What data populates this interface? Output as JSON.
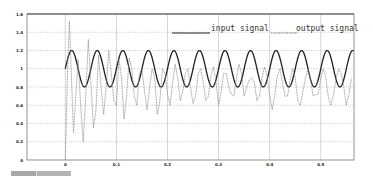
{
  "chart_data": {
    "type": "line",
    "title": "",
    "xlabel": "",
    "ylabel": "",
    "xlim": [
      -0.075,
      0.565
    ],
    "ylim": [
      0,
      1.6
    ],
    "grid": true,
    "legend_position": "top-right",
    "x_ticks": [
      "0",
      "0.1",
      "0.2",
      "0.3",
      "0.4",
      "0.5"
    ],
    "y_ticks": [
      "0",
      "0.2",
      "0.4",
      "0.6",
      "0.8",
      "1",
      "1.2",
      "1.4",
      "1.6"
    ],
    "series": [
      {
        "name": "input signal",
        "style": "solid dark",
        "description": "sinusoid 1 + 0.2*sin(2*pi*20*t), t from 0 to 0.565",
        "offset": 1.0,
        "amplitude": 0.2,
        "frequency_hz": 20
      },
      {
        "name": "output signal",
        "style": "dotted gray",
        "x": [
          0,
          0.004,
          0.008,
          0.012,
          0.016,
          0.02,
          0.025,
          0.03,
          0.035,
          0.04,
          0.045,
          0.05,
          0.055,
          0.06,
          0.065,
          0.07,
          0.075,
          0.08,
          0.085,
          0.09,
          0.095,
          0.1,
          0.105,
          0.11,
          0.115,
          0.12,
          0.125,
          0.13,
          0.135,
          0.14,
          0.145,
          0.15,
          0.155,
          0.16,
          0.165,
          0.17,
          0.175,
          0.18,
          0.185,
          0.19,
          0.195,
          0.2,
          0.205,
          0.21,
          0.215,
          0.22,
          0.225,
          0.23,
          0.235,
          0.24,
          0.245,
          0.25,
          0.255,
          0.26,
          0.265,
          0.27,
          0.275,
          0.28,
          0.285,
          0.29,
          0.295,
          0.3,
          0.305,
          0.31,
          0.315,
          0.32,
          0.325,
          0.33,
          0.335,
          0.34,
          0.345,
          0.35,
          0.355,
          0.36,
          0.365,
          0.37,
          0.375,
          0.38,
          0.385,
          0.39,
          0.395,
          0.4,
          0.405,
          0.41,
          0.415,
          0.42,
          0.425,
          0.43,
          0.435,
          0.44,
          0.445,
          0.45,
          0.455,
          0.46,
          0.465,
          0.47,
          0.475,
          0.48,
          0.485,
          0.49,
          0.495,
          0.5,
          0.505,
          0.51,
          0.515,
          0.52,
          0.525,
          0.53,
          0.535,
          0.54,
          0.545,
          0.55,
          0.555,
          0.56
        ],
        "values": [
          0.0,
          0.9,
          1.52,
          0.9,
          0.3,
          0.65,
          1.1,
          0.6,
          0.2,
          0.7,
          1.32,
          0.85,
          0.35,
          0.55,
          1.15,
          0.8,
          0.5,
          0.8,
          1.2,
          0.95,
          0.65,
          0.6,
          1.1,
          0.9,
          0.45,
          0.7,
          1.12,
          1.0,
          0.7,
          0.6,
          0.95,
          1.0,
          0.75,
          0.55,
          0.8,
          1.0,
          0.9,
          0.5,
          0.65,
          1.0,
          0.95,
          0.72,
          0.6,
          0.85,
          1.05,
          0.9,
          0.65,
          0.75,
          0.95,
          1.0,
          0.8,
          0.62,
          0.7,
          0.95,
          1.0,
          0.85,
          0.65,
          0.7,
          0.92,
          1.02,
          0.85,
          0.6,
          0.75,
          0.95,
          0.95,
          0.8,
          0.72,
          0.7,
          0.9,
          1.05,
          0.95,
          0.7,
          0.8,
          0.88,
          0.9,
          0.85,
          0.65,
          0.7,
          0.9,
          1.02,
          0.92,
          0.7,
          0.55,
          0.72,
          0.92,
          1.0,
          0.85,
          0.7,
          0.7,
          0.88,
          1.0,
          0.9,
          0.65,
          0.6,
          0.75,
          0.9,
          1.0,
          0.88,
          0.7,
          0.72,
          0.72,
          0.9,
          1.0,
          0.9,
          0.68,
          0.6,
          0.72,
          0.9,
          1.0,
          0.95,
          0.8,
          0.6,
          0.72,
          0.9
        ]
      }
    ]
  },
  "legend": {
    "input_label": "input signal",
    "output_label": "output signal"
  },
  "status_bar": {
    "segment1": "",
    "segment2": ""
  }
}
